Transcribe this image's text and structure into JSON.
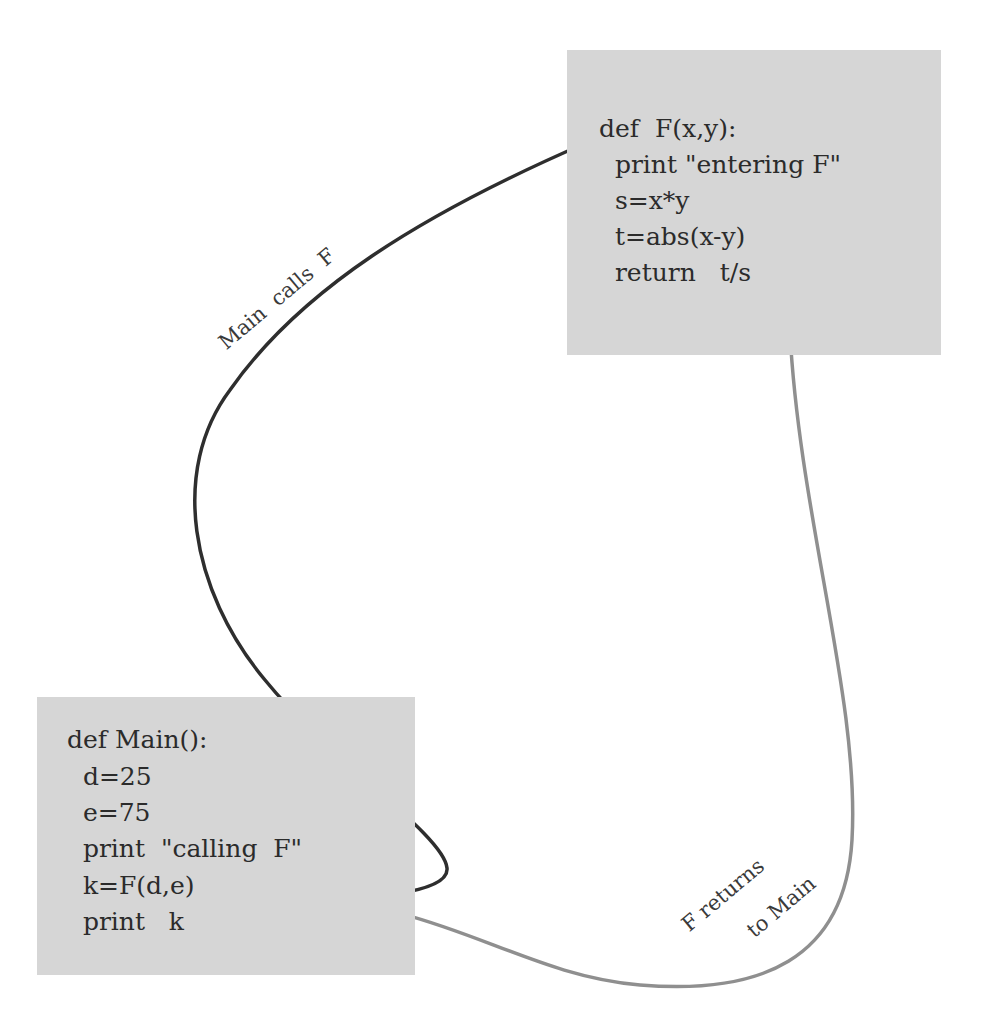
{
  "diagram": {
    "colors": {
      "box_fill": "#d6d6d6",
      "text": "#2b2b2b",
      "call_arrow": "#3a3a3a",
      "return_arrow": "#8f8f8f",
      "background": "#ffffff"
    },
    "boxes": {
      "f": {
        "name": "F",
        "lines": [
          "def  F(x,y):",
          "  print \"entering F\"",
          "  s=x*y",
          "  t=abs(x-y)",
          "  return   t/s"
        ]
      },
      "main": {
        "name": "Main",
        "lines": [
          "def Main():",
          "  d=25",
          "  e=75",
          "  print  \"calling  F\"",
          "  k=F(d,e)",
          "  print   k"
        ]
      }
    },
    "edges": [
      {
        "from": "main",
        "to": "f",
        "label": "Main  calls  F",
        "style": "dark"
      },
      {
        "from": "f",
        "to": "main",
        "label_line1": "F returns",
        "label_line2": "to Main",
        "style": "light"
      }
    ]
  }
}
